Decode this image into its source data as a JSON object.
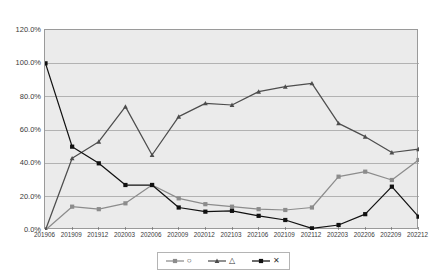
{
  "title": "      ",
  "chart_data": {
    "type": "line",
    "title": "",
    "xlabel": "",
    "ylabel": "",
    "ylim": [
      0,
      120
    ],
    "ytick_labels": [
      "0.0%",
      "20.0%",
      "40.0%",
      "60.0%",
      "80.0%",
      "100.0%",
      "120.0%"
    ],
    "ytick_values": [
      0,
      20,
      40,
      60,
      80,
      100,
      120
    ],
    "grid": "horizontal",
    "legend_position": "bottom",
    "categories": [
      "201906",
      "201909",
      "201912",
      "202003",
      "202006",
      "202009",
      "202012",
      "202103",
      "202106",
      "202109",
      "202112",
      "202203",
      "202206",
      "202209",
      "202212"
    ],
    "series": [
      {
        "name": "series-circle",
        "marker": "circle",
        "color": "#8c8c8c",
        "values": [
          0.0,
          14.0,
          12.5,
          16.0,
          27.0,
          19.0,
          15.5,
          14.0,
          12.5,
          12.0,
          13.5,
          32.0,
          35.0,
          30.0,
          42.0
        ]
      },
      {
        "name": "series-triangle",
        "marker": "triangle",
        "color": "#4d4d4d",
        "values": [
          0.0,
          43.0,
          53.0,
          74.0,
          45.0,
          68.0,
          76.0,
          75.0,
          83.0,
          86.0,
          88.0,
          64.0,
          56.0,
          46.5,
          48.5
        ]
      },
      {
        "name": "series-x",
        "marker": "x",
        "color": "#111111",
        "values": [
          100.0,
          50.0,
          40.0,
          27.0,
          27.0,
          13.5,
          11.0,
          11.5,
          8.5,
          6.0,
          1.0,
          3.0,
          9.5,
          26.0,
          8.0
        ]
      }
    ]
  },
  "legend": {
    "entries": [
      {
        "marker": "circle",
        "label": ""
      },
      {
        "marker": "triangle",
        "label": ""
      },
      {
        "marker": "x",
        "label": ""
      }
    ]
  }
}
